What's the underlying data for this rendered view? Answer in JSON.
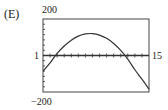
{
  "figure": {
    "panel_label": "(E)",
    "y_max_label": "200",
    "y_min_label": "−200",
    "x_left_label": "1",
    "x_right_label": "15"
  },
  "colors": {
    "line": "#333333",
    "frame": "#444444",
    "background": "#ffffff"
  },
  "chart_data": {
    "type": "line",
    "title": "(E)",
    "xlabel": "",
    "ylabel": "",
    "xlim": [
      0,
      15
    ],
    "ylim": [
      -200,
      200
    ],
    "x_tick_count": 15,
    "y_tick_count": 14,
    "grid": false,
    "legend": null,
    "annotations": [
      "200",
      "−200",
      "1",
      "15"
    ],
    "series": [
      {
        "name": "parabola",
        "x": [
          0,
          1,
          2,
          3,
          4,
          5,
          6,
          7,
          8,
          9,
          10,
          11,
          12,
          13,
          14,
          15
        ],
        "values": [
          -86,
          -40,
          12,
          52,
          84,
          106,
          118,
          120,
          112,
          94,
          66,
          28,
          -20,
          -78,
          -130,
          -184
        ]
      }
    ],
    "roots_approx": [
      1.6,
      12.2
    ],
    "vertex_approx": [
      7,
      120
    ]
  }
}
